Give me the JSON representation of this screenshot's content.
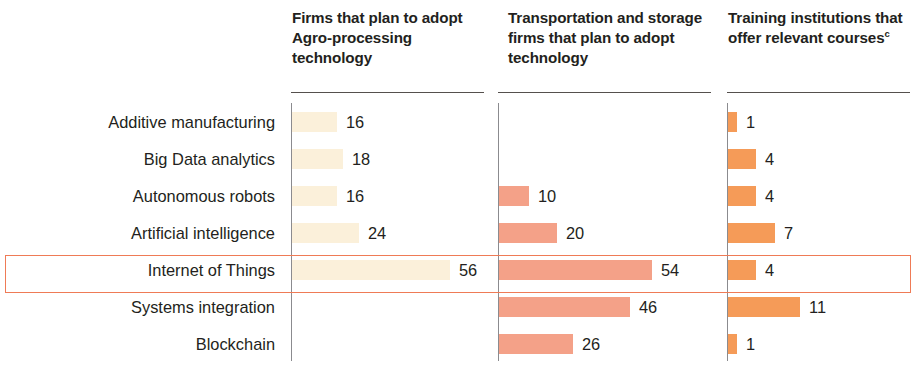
{
  "chart_data": {
    "type": "bar",
    "title": "",
    "subtitle": "",
    "xlabel": "",
    "ylabel": "",
    "grid": false,
    "legend_position": "none",
    "orientation": "horizontal",
    "categories": [
      "Additive manufacturing",
      "Big Data analytics",
      "Autonomous robots",
      "Artificial intelligence",
      "Internet of Things",
      "Systems integration",
      "Blockchain"
    ],
    "series": [
      {
        "name": "Firms that plan to adopt Agro-processing technology",
        "values": [
          16,
          18,
          16,
          24,
          56,
          null,
          null
        ],
        "color": "#fbf0da",
        "axis_max": 60,
        "px_per_unit": 2.82
      },
      {
        "name": "Transportation and storage firms that plan to adopt technology",
        "values": [
          null,
          null,
          10,
          20,
          54,
          46,
          26
        ],
        "color": "#f4a188",
        "axis_max": 60,
        "px_per_unit": 2.82
      },
      {
        "name": "Training institutions that offer relevant courses",
        "values": [
          1,
          4,
          4,
          7,
          4,
          11,
          1
        ],
        "color": "#f59b58",
        "axis_max": 12,
        "px_per_unit": 6.5
      }
    ],
    "highlighted_category": "Internet of Things",
    "highlight_color": "#ef7b56",
    "value_labels": {
      "col1": [
        "16",
        "18",
        "16",
        "24",
        "56",
        "",
        ""
      ],
      "col2": [
        "",
        "",
        "10",
        "20",
        "54",
        "46",
        "26"
      ],
      "col3": [
        "1",
        "4",
        "4",
        "7",
        "4",
        "11",
        "1"
      ]
    }
  },
  "headers": {
    "col1": "Firms that plan to adopt Agro-processing technology",
    "col2": "Transportation and storage firms that plan to adopt technology",
    "col3_main": "Training institutions that offer relevant courses",
    "col3_superscript": "c"
  },
  "rows": [
    {
      "label": "Additive manufacturing",
      "col1": {
        "value": 16,
        "label": "16",
        "bar_px": 45
      },
      "col2": {
        "value": null,
        "label": "",
        "bar_px": 0
      },
      "col3": {
        "value": 1,
        "label": "1",
        "bar_px": 9
      }
    },
    {
      "label": "Big Data analytics",
      "col1": {
        "value": 18,
        "label": "18",
        "bar_px": 51
      },
      "col2": {
        "value": null,
        "label": "",
        "bar_px": 0
      },
      "col3": {
        "value": 4,
        "label": "4",
        "bar_px": 28
      }
    },
    {
      "label": "Autonomous robots",
      "col1": {
        "value": 16,
        "label": "16",
        "bar_px": 45
      },
      "col2": {
        "value": 10,
        "label": "10",
        "bar_px": 30
      },
      "col3": {
        "value": 4,
        "label": "4",
        "bar_px": 28
      }
    },
    {
      "label": "Artificial intelligence",
      "col1": {
        "value": 24,
        "label": "24",
        "bar_px": 67
      },
      "col2": {
        "value": 20,
        "label": "20",
        "bar_px": 58
      },
      "col3": {
        "value": 7,
        "label": "7",
        "bar_px": 47
      }
    },
    {
      "label": "Internet of Things",
      "col1": {
        "value": 56,
        "label": "56",
        "bar_px": 158
      },
      "col2": {
        "value": 54,
        "label": "54",
        "bar_px": 153
      },
      "col3": {
        "value": 4,
        "label": "4",
        "bar_px": 28
      }
    },
    {
      "label": "Systems integration",
      "col1": {
        "value": null,
        "label": "",
        "bar_px": 0
      },
      "col2": {
        "value": 46,
        "label": "46",
        "bar_px": 131
      },
      "col3": {
        "value": 11,
        "label": "11",
        "bar_px": 72
      }
    },
    {
      "label": "Blockchain",
      "col1": {
        "value": null,
        "label": "",
        "bar_px": 0
      },
      "col2": {
        "value": 26,
        "label": "26",
        "bar_px": 74
      },
      "col3": {
        "value": 1,
        "label": "1",
        "bar_px": 9
      }
    }
  ]
}
